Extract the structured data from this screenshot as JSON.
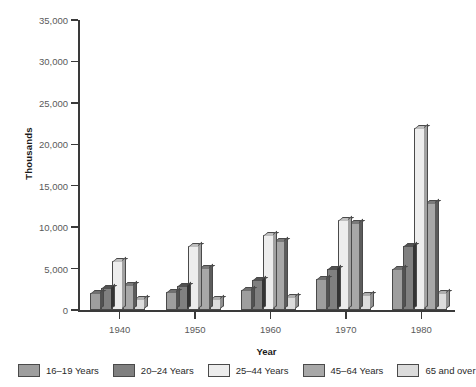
{
  "chart_data": {
    "type": "bar",
    "title": "",
    "xlabel": "Year",
    "ylabel": "Thousands",
    "categories": [
      "1940",
      "1950",
      "1960",
      "1970",
      "1980"
    ],
    "ylim": [
      0,
      35000
    ],
    "ytick_labels": [
      "0",
      "5,000",
      "10,000",
      "15,000",
      "20,000",
      "25,000",
      "30,000",
      "35,000"
    ],
    "ytick_values": [
      0,
      5000,
      10000,
      15000,
      20000,
      25000,
      30000,
      35000
    ],
    "grid": false,
    "legend_position": "bottom",
    "series": [
      {
        "name": "16–19 Years",
        "color": "#9e9e9e",
        "values": [
          2000,
          2200,
          2400,
          3700,
          4900
        ]
      },
      {
        "name": "20–24 Years",
        "color": "#808080",
        "values": [
          2600,
          2900,
          3600,
          5000,
          7700
        ]
      },
      {
        "name": "25–44 Years",
        "color": "#ededed",
        "values": [
          5900,
          7700,
          9100,
          10900,
          22000
        ]
      },
      {
        "name": "45–64 Years",
        "color": "#a8a8a8",
        "values": [
          3000,
          5100,
          8300,
          10500,
          12900
        ]
      },
      {
        "name": "65 and over",
        "color": "#dcdcdc",
        "values": [
          1300,
          1300,
          1600,
          1800,
          2000
        ]
      }
    ]
  },
  "axis": {
    "y_title": "Thousands",
    "x_title": "Year"
  }
}
